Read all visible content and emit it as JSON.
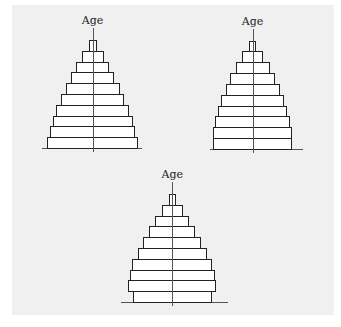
{
  "chart_data": [
    {
      "type": "bar",
      "subtype": "population-pyramid",
      "title": "",
      "ylabel": "Age",
      "xlabel": "",
      "age_groups_bottom_to_top": 10,
      "bar_widths_bottom_to_top": [
        90.4,
        85.7,
        80,
        72.3,
        63.6,
        54,
        43.5,
        33,
        22,
        8
      ],
      "shape": "expansive (wide base, steadily narrowing)",
      "grid": false,
      "legend": null
    },
    {
      "type": "bar",
      "subtype": "population-pyramid",
      "title": "",
      "ylabel": "Age",
      "xlabel": "",
      "age_groups_bottom_to_top": 10,
      "bar_widths_bottom_to_top": [
        79,
        79,
        74.3,
        69,
        62.3,
        54,
        44.6,
        34,
        21,
        6.7
      ],
      "shape": "stationary base (bottom two groups equal)",
      "grid": false,
      "legend": null
    },
    {
      "type": "bar",
      "subtype": "population-pyramid",
      "title": "",
      "ylabel": "Age",
      "xlabel": "",
      "age_groups_bottom_to_top": 10,
      "bar_widths_bottom_to_top": [
        79,
        87.7,
        85,
        80.4,
        69.6,
        58.4,
        46,
        34,
        21,
        7.4
      ],
      "shape": "constrictive base (youngest group narrower than next)",
      "grid": false,
      "legend": null
    }
  ],
  "pyramids": [
    {
      "label": "Age",
      "cx": 92.5,
      "top": 40,
      "baseline": 148,
      "axis_left": 42,
      "axis_right": 142,
      "widths_top_to_bottom": [
        8,
        22,
        33,
        43.5,
        54,
        63.6,
        72.3,
        80,
        85.7,
        90.4
      ]
    },
    {
      "label": "Age",
      "cx": 252.5,
      "top": 40.5,
      "baseline": 149,
      "axis_left": 210,
      "axis_right": 303,
      "widths_top_to_bottom": [
        6.7,
        21,
        34,
        44.6,
        54,
        62.3,
        69,
        74.3,
        79,
        79
      ]
    },
    {
      "label": "Age",
      "cx": 172.3,
      "top": 194,
      "baseline": 302,
      "axis_left": 121,
      "axis_right": 228,
      "widths_top_to_bottom": [
        7.4,
        21,
        34,
        46,
        58.4,
        69.6,
        80.4,
        85,
        87.7,
        79
      ]
    }
  ],
  "colors": {
    "panel": "#f0f0f0",
    "bar_fill": "#ffffff",
    "bar_stroke": "#222222",
    "axis": "#555555"
  }
}
